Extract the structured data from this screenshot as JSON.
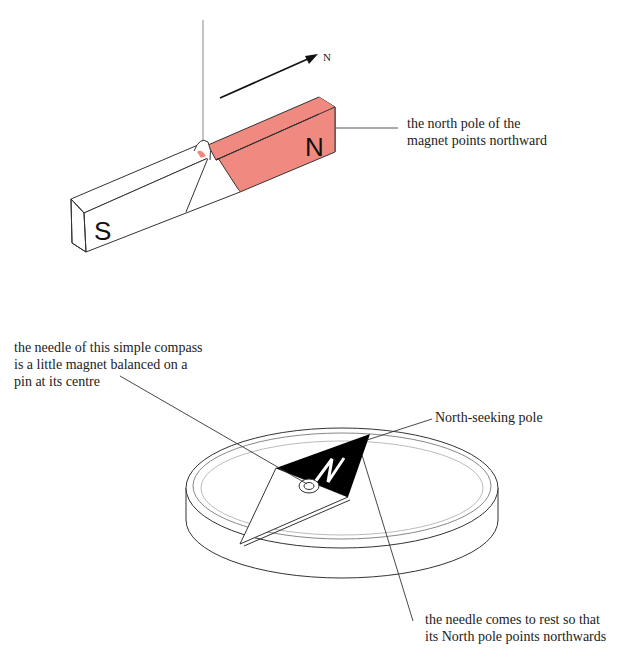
{
  "colors": {
    "north_pole_fill": "#f08a80",
    "line": "#333333",
    "thin_line": "#777777",
    "needle_black": "#000000",
    "background": "#ffffff"
  },
  "magnet_figure": {
    "direction_label": "N",
    "pole_south_label": "S",
    "pole_north_label": "N",
    "callout": {
      "lines": [
        "the north pole of the",
        "magnet points northward"
      ]
    }
  },
  "compass_figure": {
    "needle_letter": "N",
    "callout_needle": {
      "lines": [
        "the needle of this simple compass",
        "is a little magnet balanced on a",
        "pin at its centre"
      ]
    },
    "callout_pole": {
      "lines": [
        "North-seeking pole"
      ]
    },
    "callout_rest": {
      "lines": [
        "the needle comes to rest so that",
        "its North pole points northwards"
      ]
    }
  }
}
